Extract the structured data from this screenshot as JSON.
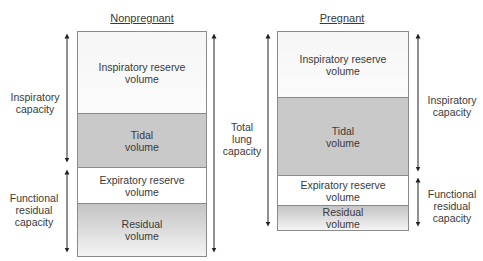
{
  "columns": [
    {
      "title": "Nonpregnant",
      "segments": [
        {
          "name": "inspiratory-reserve-volume",
          "label_line1": "Inspiratory reserve",
          "label_line2": "volume"
        },
        {
          "name": "tidal-volume",
          "label_line1": "Tidal",
          "label_line2": "volume"
        },
        {
          "name": "expiratory-reserve-volume",
          "label_line1": "Expiratory reserve",
          "label_line2": "volume"
        },
        {
          "name": "residual-volume",
          "label_line1": "Residual",
          "label_line2": "volume"
        }
      ],
      "capacities": {
        "inspiratory": {
          "line1": "Inspiratory",
          "line2": "capacity"
        },
        "functional_residual": {
          "line1": "Functional",
          "line2": "residual",
          "line3": "capacity"
        }
      }
    },
    {
      "title": "Pregnant",
      "segments": [
        {
          "name": "inspiratory-reserve-volume",
          "label_line1": "Inspiratory reserve",
          "label_line2": "volume"
        },
        {
          "name": "tidal-volume",
          "label_line1": "Tidal",
          "label_line2": "volume"
        },
        {
          "name": "expiratory-reserve-volume",
          "label_line1": "Expiratory reserve",
          "label_line2": "volume"
        },
        {
          "name": "residual-volume",
          "label_line1": "Residual",
          "label_line2": "volume"
        }
      ],
      "capacities": {
        "inspiratory": {
          "line1": "Inspiratory",
          "line2": "capacity"
        },
        "functional_residual": {
          "line1": "Functional",
          "line2": "residual",
          "line3": "capacity"
        }
      }
    }
  ],
  "total_lung_capacity": {
    "line1": "Total",
    "line2": "lung",
    "line3": "capacity"
  },
  "colors": {
    "outline": "#8a8a8a",
    "gray_fill": "#c9c9c9",
    "text": "#3a3a3a",
    "arrow": "#222222"
  }
}
